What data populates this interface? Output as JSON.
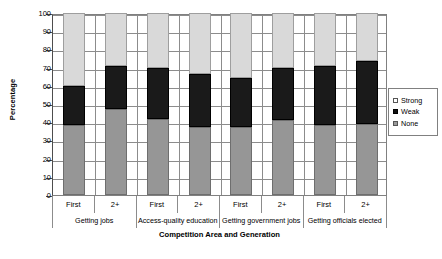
{
  "chart_data": {
    "type": "bar",
    "subtype": "stacked-column-100",
    "title": "",
    "xlabel": "Competition Area and Generation",
    "ylabel": "Percentage",
    "ylim": [
      0,
      100
    ],
    "yticks": [
      0,
      10,
      20,
      30,
      40,
      50,
      60,
      70,
      80,
      90,
      100
    ],
    "grid": true,
    "legend_position": "right",
    "categories": [
      "First",
      "2+",
      "First",
      "2+",
      "First",
      "2+",
      "First",
      "2+"
    ],
    "groups": [
      "Getting jobs",
      "Access-quality education",
      "Getting government jobs",
      "Getting officials elected"
    ],
    "series": [
      {
        "name": "None",
        "color": "#969696",
        "values": [
          38.5,
          47.5,
          42.0,
          37.5,
          37.5,
          41.0,
          38.5,
          39.0
        ]
      },
      {
        "name": "Weak",
        "color": "#1a1a1a",
        "values": [
          21.5,
          23.5,
          28.0,
          29.0,
          27.0,
          29.0,
          32.5,
          34.5
        ]
      },
      {
        "name": "Strong",
        "color": "#d9d9d9",
        "values": [
          40.0,
          29.0,
          30.0,
          33.5,
          35.5,
          30.0,
          29.0,
          26.5
        ]
      }
    ],
    "stack_order": [
      "None",
      "Weak",
      "Strong"
    ]
  },
  "legend": {
    "entries": [
      {
        "label": "Strong",
        "swatch": "strong"
      },
      {
        "label": "Weak",
        "swatch": "weak"
      },
      {
        "label": "None",
        "swatch": "none"
      }
    ]
  }
}
